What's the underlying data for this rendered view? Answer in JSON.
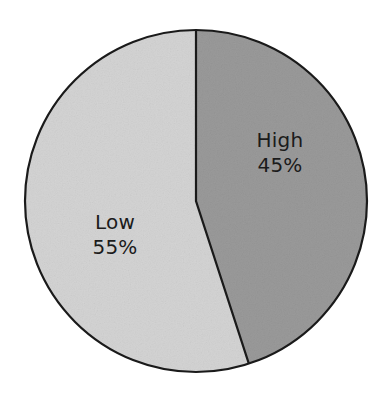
{
  "chart_data": {
    "type": "pie",
    "title": "",
    "subtitle": "",
    "xlabel": "",
    "ylabel": "",
    "legend_position": "none",
    "grid": false,
    "labels_inside_slices": true,
    "start_angle_deg": 0,
    "direction": "clockwise",
    "categories": [
      "High",
      "Low"
    ],
    "values": [
      45,
      55
    ],
    "value_unit": "%",
    "slices": [
      {
        "name": "High",
        "value": 45,
        "value_label": "45%",
        "color": "#9a9a9a",
        "start_angle_deg": 0,
        "end_angle_deg": 162
      },
      {
        "name": "Low",
        "value": 55,
        "value_label": "55%",
        "color": "#d4d4d4",
        "start_angle_deg": 162,
        "end_angle_deg": 360
      }
    ]
  },
  "figure": {
    "background_color": "#ffffff",
    "outline_color": "#1a1a1a",
    "outline_width": 2,
    "center_x": 196,
    "center_y": 201,
    "radius": 171,
    "text_color": "#1b1b1b"
  },
  "labels": {
    "high": {
      "name": "High",
      "value": "45%"
    },
    "low": {
      "name": "Low",
      "value": "55%"
    }
  }
}
